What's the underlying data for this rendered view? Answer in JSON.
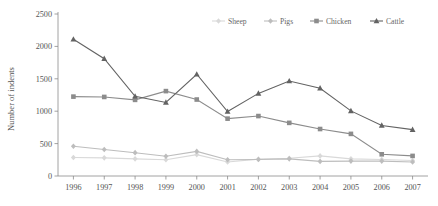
{
  "chart_data": {
    "type": "line",
    "title": "",
    "xlabel": "",
    "ylabel": "Number of indents",
    "categories": [
      "1996",
      "1997",
      "1998",
      "1999",
      "2000",
      "2001",
      "2002",
      "2003",
      "2004",
      "2005",
      "2006",
      "2007"
    ],
    "ylim": [
      0,
      2500
    ],
    "yticks": [
      0,
      500,
      1000,
      1500,
      2000,
      2500
    ],
    "ytick_labels": [
      "0",
      "500",
      "1000",
      "1500",
      "2000",
      "2500"
    ],
    "grid": false,
    "legend_position": "top-right",
    "series": [
      {
        "name": "Sheep",
        "color": "#d9d9d9",
        "marker": "diamond",
        "values": [
          285,
          280,
          265,
          250,
          330,
          215,
          260,
          275,
          310,
          265,
          255,
          240
        ]
      },
      {
        "name": "Pigs",
        "color": "#bdbdbd",
        "marker": "diamond",
        "values": [
          460,
          410,
          360,
          305,
          380,
          250,
          255,
          265,
          225,
          230,
          230,
          215
        ]
      },
      {
        "name": "Chicken",
        "color": "#8c8c8c",
        "marker": "square",
        "values": [
          1225,
          1220,
          1175,
          1310,
          1180,
          885,
          925,
          820,
          725,
          650,
          335,
          310
        ]
      },
      {
        "name": "Cattle",
        "color": "#636363",
        "marker": "triangle",
        "values": [
          2110,
          1810,
          1230,
          1135,
          1570,
          995,
          1275,
          1465,
          1355,
          1005,
          780,
          715
        ]
      }
    ]
  },
  "axis": {
    "y_title": "Number of indents"
  },
  "legend": {
    "items": [
      {
        "label": "Sheep"
      },
      {
        "label": "Pigs"
      },
      {
        "label": "Chicken"
      },
      {
        "label": "Cattle"
      }
    ]
  }
}
